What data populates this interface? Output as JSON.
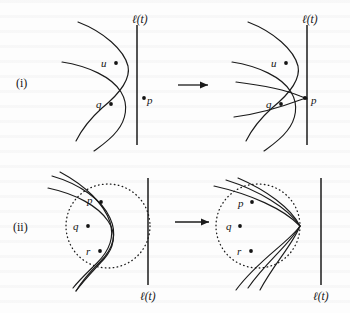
{
  "figure": {
    "kind": "geometry-diagram",
    "background_color": "#fdfdfd",
    "ink_color": "#1b1b1b"
  },
  "rows": [
    {
      "id": "row-i",
      "row_label": "(i)",
      "transition_arrow": "→",
      "panels": [
        {
          "id": "panel-i-before",
          "sweepline_label": "ℓ(t)",
          "sweepline_label_position": "top",
          "sites": [
            {
              "name": "u",
              "label": "u",
              "label_side": "left"
            },
            {
              "name": "q",
              "label": "q",
              "label_side": "left"
            },
            {
              "name": "p",
              "label": "p",
              "label_side": "right"
            }
          ]
        },
        {
          "id": "panel-i-after",
          "sweepline_label": "ℓ(t)",
          "sweepline_label_position": "top",
          "sites": [
            {
              "name": "u",
              "label": "u",
              "label_side": "left"
            },
            {
              "name": "q",
              "label": "q",
              "label_side": "left"
            },
            {
              "name": "p",
              "label": "p",
              "label_side": "right"
            }
          ]
        }
      ]
    },
    {
      "id": "row-ii",
      "row_label": "(ii)",
      "transition_arrow": "→",
      "panels": [
        {
          "id": "panel-ii-before",
          "sweepline_label": "ℓ(t)",
          "sweepline_label_position": "bottom",
          "sites": [
            {
              "name": "p",
              "label": "p",
              "label_side": "left"
            },
            {
              "name": "q",
              "label": "q",
              "label_side": "left"
            },
            {
              "name": "r",
              "label": "r",
              "label_side": "left"
            }
          ]
        },
        {
          "id": "panel-ii-after",
          "sweepline_label": "ℓ(t)",
          "sweepline_label_position": "bottom",
          "sites": [
            {
              "name": "p",
              "label": "p",
              "label_side": "left"
            },
            {
              "name": "q",
              "label": "q",
              "label_side": "left"
            },
            {
              "name": "r",
              "label": "r",
              "label_side": "left"
            }
          ]
        }
      ]
    }
  ],
  "labels": {
    "row_i": "(i)",
    "row_ii": "(ii)",
    "sweep_i_left": "ℓ(t)",
    "sweep_i_right": "ℓ(t)",
    "sweep_ii_left": "ℓ(t)",
    "sweep_ii_right": "ℓ(t)",
    "i_left_u": "u",
    "i_left_q": "q",
    "i_left_p": "p",
    "i_right_u": "u",
    "i_right_q": "q",
    "i_right_p": "p",
    "ii_left_p": "p",
    "ii_left_q": "q",
    "ii_left_r": "r",
    "ii_right_p": "p",
    "ii_right_q": "q",
    "ii_right_r": "r"
  }
}
